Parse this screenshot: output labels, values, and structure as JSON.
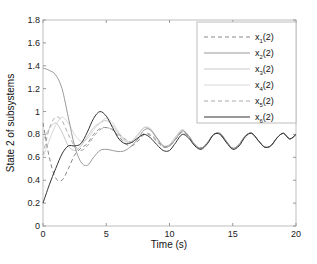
{
  "chart_data": {
    "type": "line",
    "title": "",
    "xlabel": "Time (s)",
    "ylabel": "State 2 of subsystems",
    "xlim": [
      0,
      20
    ],
    "ylim": [
      0,
      1.8
    ],
    "xticks": [
      0,
      5,
      10,
      15,
      20
    ],
    "yticks": [
      0,
      0.2,
      0.4,
      0.6,
      0.8,
      1,
      1.2,
      1.4,
      1.6,
      1.8
    ],
    "xtick_labels": [
      "0",
      "5",
      "10",
      "15",
      "20"
    ],
    "ytick_labels": [
      "0",
      "0.2",
      "0.4",
      "0.6",
      "0.8",
      "1",
      "1.2",
      "1.4",
      "1.6",
      "1.8"
    ],
    "grid": false,
    "legend_position": "upper right",
    "x": [
      0,
      0.5,
      1,
      1.5,
      2,
      2.5,
      3,
      3.5,
      4,
      4.5,
      5,
      5.5,
      6,
      6.5,
      7,
      7.5,
      8,
      8.5,
      9,
      9.5,
      10,
      10.5,
      11,
      11.5,
      12,
      12.5,
      13,
      13.5,
      14,
      14.5,
      15,
      15.5,
      16,
      16.5,
      17,
      17.5,
      18,
      18.5,
      19,
      19.5,
      20
    ],
    "series": [
      {
        "name": "x1(2)",
        "style": "dashed",
        "color": "#888888",
        "values": [
          0.9,
          0.6,
          0.42,
          0.4,
          0.5,
          0.62,
          0.68,
          0.72,
          0.8,
          0.85,
          0.86,
          0.84,
          0.78,
          0.72,
          0.7,
          0.74,
          0.8,
          0.79,
          0.74,
          0.69,
          0.7,
          0.76,
          0.82,
          0.78,
          0.71,
          0.68,
          0.73,
          0.8,
          0.8,
          0.73,
          0.68,
          0.71,
          0.79,
          0.81,
          0.75,
          0.69,
          0.7,
          0.77,
          0.81,
          0.76,
          0.8
        ]
      },
      {
        "name": "x2(2)",
        "style": "solid",
        "color": "#999999",
        "values": [
          1.38,
          1.36,
          1.32,
          1.2,
          0.95,
          0.7,
          0.56,
          0.53,
          0.6,
          0.66,
          0.67,
          0.66,
          0.65,
          0.66,
          0.7,
          0.76,
          0.84,
          0.84,
          0.77,
          0.7,
          0.7,
          0.76,
          0.83,
          0.79,
          0.71,
          0.68,
          0.73,
          0.8,
          0.81,
          0.74,
          0.68,
          0.71,
          0.79,
          0.81,
          0.75,
          0.69,
          0.7,
          0.77,
          0.81,
          0.76,
          0.8
        ]
      },
      {
        "name": "x3(2)",
        "style": "solid",
        "color": "#c8c8c8",
        "values": [
          0.75,
          0.85,
          0.9,
          0.82,
          0.7,
          0.66,
          0.7,
          0.78,
          0.86,
          0.9,
          0.92,
          0.88,
          0.8,
          0.74,
          0.74,
          0.8,
          0.86,
          0.84,
          0.76,
          0.7,
          0.71,
          0.78,
          0.84,
          0.79,
          0.71,
          0.68,
          0.73,
          0.8,
          0.81,
          0.74,
          0.68,
          0.71,
          0.79,
          0.81,
          0.75,
          0.69,
          0.7,
          0.77,
          0.81,
          0.76,
          0.8
        ]
      },
      {
        "name": "x4(2)",
        "style": "solid",
        "color": "#d8d8d8",
        "values": [
          0.6,
          0.75,
          0.88,
          0.95,
          0.9,
          0.8,
          0.74,
          0.76,
          0.84,
          0.9,
          0.94,
          0.9,
          0.82,
          0.75,
          0.74,
          0.79,
          0.86,
          0.85,
          0.77,
          0.7,
          0.71,
          0.78,
          0.84,
          0.79,
          0.71,
          0.68,
          0.73,
          0.8,
          0.81,
          0.74,
          0.68,
          0.71,
          0.79,
          0.81,
          0.75,
          0.69,
          0.7,
          0.77,
          0.81,
          0.76,
          0.8
        ]
      },
      {
        "name": "x5(2)",
        "style": "dashed",
        "color": "#aaaaaa",
        "values": [
          0.62,
          0.85,
          0.95,
          0.92,
          0.8,
          0.7,
          0.66,
          0.7,
          0.78,
          0.84,
          0.86,
          0.84,
          0.8,
          0.76,
          0.73,
          0.76,
          0.81,
          0.8,
          0.75,
          0.69,
          0.7,
          0.76,
          0.82,
          0.78,
          0.71,
          0.68,
          0.73,
          0.8,
          0.8,
          0.73,
          0.68,
          0.71,
          0.79,
          0.81,
          0.75,
          0.69,
          0.7,
          0.77,
          0.81,
          0.76,
          0.8
        ]
      },
      {
        "name": "x6(2)",
        "style": "solid",
        "color": "#333333",
        "values": [
          0.2,
          0.36,
          0.5,
          0.63,
          0.7,
          0.7,
          0.72,
          0.82,
          0.94,
          1.0,
          0.96,
          0.86,
          0.76,
          0.72,
          0.73,
          0.77,
          0.8,
          0.77,
          0.71,
          0.66,
          0.66,
          0.73,
          0.8,
          0.77,
          0.7,
          0.67,
          0.72,
          0.8,
          0.8,
          0.73,
          0.67,
          0.7,
          0.78,
          0.81,
          0.75,
          0.69,
          0.7,
          0.77,
          0.81,
          0.76,
          0.8
        ]
      }
    ]
  }
}
